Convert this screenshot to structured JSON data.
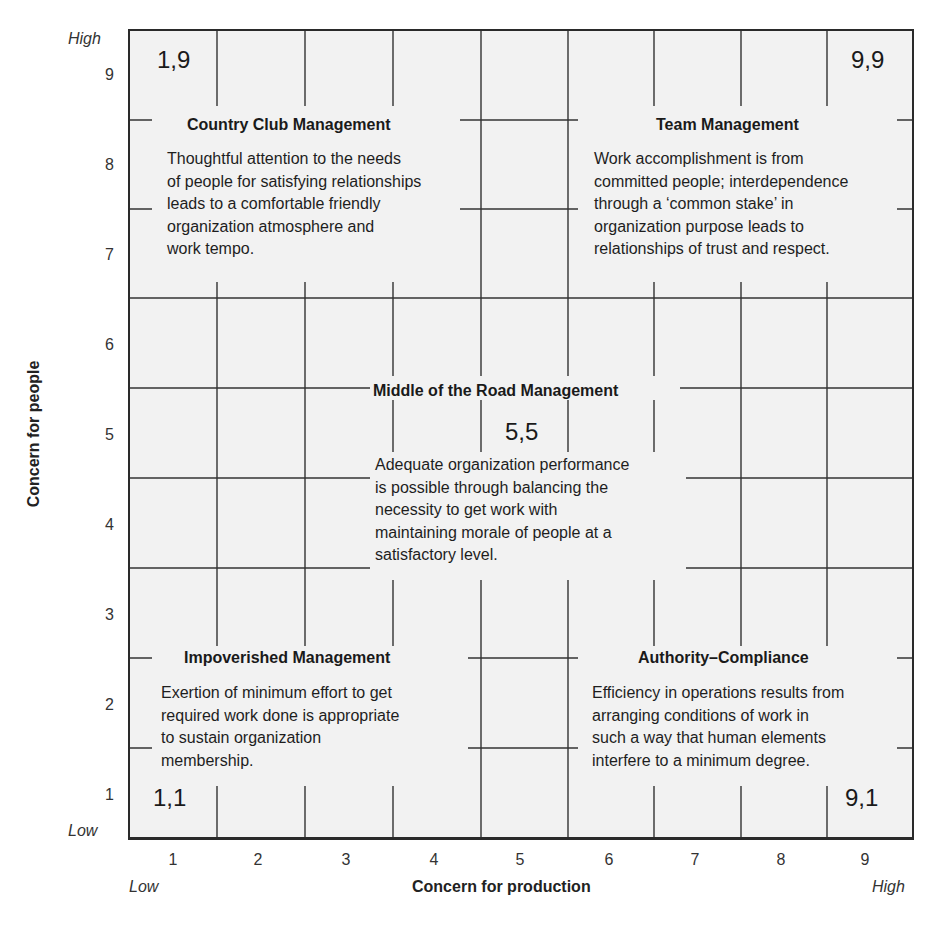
{
  "diagram": {
    "x_axis": {
      "title": "Concern for production",
      "low_label": "Low",
      "high_label": "High",
      "ticks": [
        "1",
        "2",
        "3",
        "4",
        "5",
        "6",
        "7",
        "8",
        "9"
      ]
    },
    "y_axis": {
      "title": "Concern for people",
      "low_label": "Low",
      "high_label": "High",
      "ticks": [
        "9",
        "8",
        "7",
        "6",
        "5",
        "4",
        "3",
        "2",
        "1"
      ]
    },
    "colors": {
      "grid_background": "#f2f2f2",
      "grid_line": "#333333",
      "text": "#1e1e1e"
    },
    "styles": [
      {
        "id": "country-club",
        "coordinate": "1,9",
        "title": "Country Club Management",
        "description": "Thoughtful attention to the needs\nof people for satisfying relationships\nleads to a comfortable friendly\norganization atmosphere and\nwork tempo."
      },
      {
        "id": "team",
        "coordinate": "9,9",
        "title": "Team Management",
        "description": "Work accomplishment is from\ncommitted people; interdependence\nthrough a ‘common stake’ in\norganization purpose leads to\nrelationships of trust and respect."
      },
      {
        "id": "middle-of-the-road",
        "coordinate": "5,5",
        "title": "Middle of the Road Management",
        "description": "Adequate organization performance\nis possible through balancing the\nnecessity to get work with\nmaintaining morale of people at a\nsatisfactory level."
      },
      {
        "id": "impoverished",
        "coordinate": "1,1",
        "title": "Impoverished Management",
        "description": "Exertion of minimum effort to get\nrequired work done is appropriate\nto sustain organization\nmembership."
      },
      {
        "id": "authority-compliance",
        "coordinate": "9,1",
        "title": "Authority–Compliance",
        "description": "Efficiency in operations results from\narranging conditions of work in\nsuch a way that human elements\ninterfere to a minimum degree."
      }
    ]
  }
}
